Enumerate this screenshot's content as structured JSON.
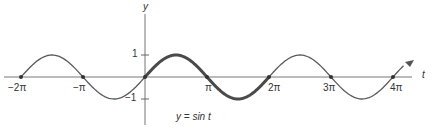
{
  "chart_data": {
    "type": "line",
    "title": "",
    "xlabel": "t",
    "ylabel": "y",
    "function": "y = sin t",
    "xlim": [
      -6.6,
      13.2
    ],
    "ylim": [
      -1.8,
      1.8
    ],
    "grid": false,
    "legend": null,
    "x_ticks": [
      {
        "value": -6.2832,
        "label": "−2π"
      },
      {
        "value": -3.1416,
        "label": "−π"
      },
      {
        "value": 3.1416,
        "label": "π"
      },
      {
        "value": 6.2832,
        "label": "2π"
      },
      {
        "value": 9.4248,
        "label": "3π"
      },
      {
        "value": 12.5664,
        "label": "4π"
      }
    ],
    "y_ticks": [
      {
        "value": 1,
        "label": "1"
      },
      {
        "value": -1,
        "label": "−1"
      }
    ],
    "series": [
      {
        "name": "sin t",
        "x_range": [
          -6.2832,
          13.1
        ],
        "style": "thin"
      },
      {
        "name": "sin t (one period highlighted)",
        "x_range": [
          0,
          6.2832
        ],
        "style": "thick"
      }
    ],
    "marked_points": [
      {
        "x": -6.2832,
        "y": 0
      },
      {
        "x": -3.1416,
        "y": 0
      },
      {
        "x": 0,
        "y": 0
      },
      {
        "x": 3.1416,
        "y": 0
      },
      {
        "x": 6.2832,
        "y": 0
      },
      {
        "x": 9.4248,
        "y": 0
      },
      {
        "x": 12.5664,
        "y": 0
      }
    ],
    "annotations": [
      {
        "text": "y = sin t",
        "x": 2.2,
        "y": -1.5
      }
    ]
  },
  "labels": {
    "y_axis": "y",
    "x_axis": "t",
    "tick_neg2pi": "−2π",
    "tick_negpi": "−π",
    "tick_pi": "π",
    "tick_2pi": "2π",
    "tick_3pi": "3π",
    "tick_4pi": "4π",
    "tick_1": "1",
    "tick_neg1": "−1",
    "equation": "y = sin t"
  },
  "colors": {
    "curve": "#555555",
    "axis": "#666666",
    "text": "#333333"
  }
}
